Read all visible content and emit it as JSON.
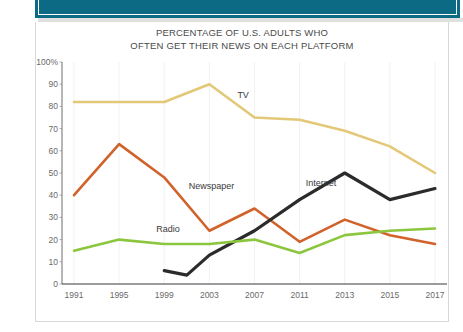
{
  "banner": {
    "color": "#0d6a85",
    "label": "teal-header-band"
  },
  "title": {
    "line1": "PERCENTAGE OF U.S. ADULTS WHO",
    "line2": "OFTEN GET THEIR NEWS ON EACH PLATFORM"
  },
  "axis": {
    "y_ticks": [
      "100%",
      "90",
      "80",
      "70",
      "60",
      "50",
      "40",
      "30",
      "20",
      "10",
      "0"
    ],
    "x_ticks": [
      "1991",
      "1995",
      "1999",
      "2003",
      "2007",
      "2011",
      "2013",
      "2015",
      "2017"
    ]
  },
  "series_labels": {
    "tv": "TV",
    "newspaper": "Newspaper",
    "internet": "Internet",
    "radio": "Radio"
  },
  "colors": {
    "tv": "#e3c878",
    "newspaper": "#d1622a",
    "internet": "#2b2b2b",
    "radio": "#8cc63e",
    "axis": "#7a7a7a",
    "text": "#4a4a4a"
  },
  "chart_data": {
    "type": "line",
    "title": "PERCENTAGE OF U.S. ADULTS WHO OFTEN GET THEIR NEWS ON EACH PLATFORM",
    "xlabel": "",
    "ylabel": "",
    "x": [
      "1991",
      "1995",
      "1999",
      "2003",
      "2007",
      "2011",
      "2013",
      "2015",
      "2017"
    ],
    "xlim": [
      "1991",
      "2017"
    ],
    "ylim": [
      0,
      100
    ],
    "yticks": [
      0,
      10,
      20,
      30,
      40,
      50,
      60,
      70,
      80,
      90,
      100
    ],
    "grid": false,
    "legend": "inline-labels",
    "series": [
      {
        "name": "TV",
        "color": "#e3c878",
        "x": [
          "1991",
          "1995",
          "1999",
          "2003",
          "2007",
          "2011",
          "2013",
          "2015",
          "2017"
        ],
        "values": [
          82,
          82,
          82,
          90,
          75,
          74,
          69,
          62,
          50
        ]
      },
      {
        "name": "Newspaper",
        "color": "#d1622a",
        "x": [
          "1991",
          "1995",
          "1999",
          "2003",
          "2007",
          "2011",
          "2013",
          "2015",
          "2017"
        ],
        "values": [
          40,
          63,
          48,
          24,
          34,
          19,
          29,
          22,
          18
        ]
      },
      {
        "name": "Internet",
        "color": "#2b2b2b",
        "x": [
          "1999",
          "2001",
          "2003",
          "2007",
          "2011",
          "2013",
          "2015",
          "2017"
        ],
        "values": [
          6,
          4,
          13,
          24,
          38,
          50,
          38,
          43
        ]
      },
      {
        "name": "Radio",
        "color": "#8cc63e",
        "x": [
          "1991",
          "1995",
          "1999",
          "2003",
          "2007",
          "2011",
          "2013",
          "2015",
          "2017"
        ],
        "values": [
          15,
          20,
          18,
          18,
          20,
          14,
          22,
          24,
          25
        ]
      }
    ]
  }
}
